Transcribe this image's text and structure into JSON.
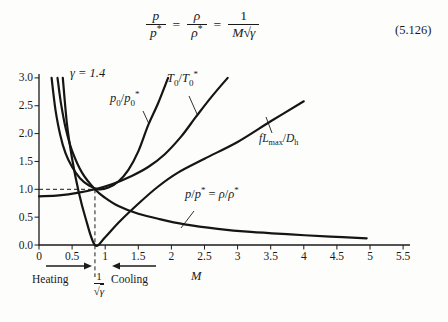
{
  "equation": {
    "f1": {
      "num": "p",
      "den": "p",
      "sup": "*"
    },
    "f2": {
      "num": "ρ",
      "den": "ρ",
      "sup": "*"
    },
    "f3": {
      "num": "1",
      "den_pre": "M",
      "radical": "√",
      "den_rad": "γ"
    },
    "eq1": "=",
    "eq2": "=",
    "number": "(5.126)"
  },
  "chart_data": {
    "type": "line",
    "title": "",
    "xlabel": "M",
    "ylabel": "",
    "gamma_label": "γ = 1.4",
    "xlim": [
      0,
      5.5
    ],
    "ylim": [
      0,
      3.0
    ],
    "grid": false,
    "x_tick_values": [
      0,
      0.5,
      1,
      1.5,
      2,
      2.5,
      3,
      3.5,
      4,
      4.5,
      5,
      5.5
    ],
    "x_tick_labels": [
      "0",
      "0.5",
      "1",
      "1.5",
      "2",
      "2.5",
      "3",
      "3.5",
      "4",
      "4.5",
      "5",
      "5.5"
    ],
    "y_tick_values": [
      0,
      0.5,
      1,
      1.5,
      2,
      2.5,
      3
    ],
    "y_tick_labels": [
      "0.0",
      "0.5",
      "1.0",
      "1.5",
      "2.0",
      "2.5",
      "3.0"
    ],
    "critical_mach": 0.845,
    "reference_value": 1.0,
    "series": [
      {
        "name": "p0/p0*",
        "points": [
          [
            0.19,
            3.0
          ],
          [
            0.25,
            2.42
          ],
          [
            0.32,
            1.98
          ],
          [
            0.4,
            1.65
          ],
          [
            0.5,
            1.4
          ],
          [
            0.62,
            1.2
          ],
          [
            0.75,
            1.07
          ],
          [
            0.9,
            1.0
          ],
          [
            1.05,
            1.03
          ],
          [
            1.2,
            1.14
          ],
          [
            1.35,
            1.35
          ],
          [
            1.5,
            1.68
          ],
          [
            1.65,
            2.15
          ],
          [
            1.8,
            2.55
          ],
          [
            1.95,
            3.0
          ]
        ]
      },
      {
        "name": "T0/T0*",
        "points": [
          [
            0.0,
            0.875
          ],
          [
            0.3,
            0.89
          ],
          [
            0.6,
            0.94
          ],
          [
            0.845,
            1.0
          ],
          [
            1.1,
            1.09
          ],
          [
            1.4,
            1.24
          ],
          [
            1.65,
            1.4
          ],
          [
            1.9,
            1.63
          ],
          [
            2.15,
            1.95
          ],
          [
            2.37,
            2.3
          ],
          [
            2.6,
            2.65
          ],
          [
            2.85,
            3.0
          ]
        ]
      },
      {
        "name": "fLmax/Dh",
        "points": [
          [
            0.36,
            3.0
          ],
          [
            0.42,
            2.2
          ],
          [
            0.5,
            1.55
          ],
          [
            0.6,
            0.95
          ],
          [
            0.7,
            0.5
          ],
          [
            0.845,
            0.0
          ],
          [
            1.0,
            0.14
          ],
          [
            1.2,
            0.4
          ],
          [
            1.5,
            0.74
          ],
          [
            1.8,
            1.05
          ],
          [
            2.1,
            1.3
          ],
          [
            2.5,
            1.55
          ],
          [
            3.0,
            1.85
          ],
          [
            3.5,
            2.22
          ],
          [
            4.0,
            2.58
          ]
        ]
      },
      {
        "name": "p/p* = ρ/ρ*",
        "points": [
          [
            0.28,
            3.0
          ],
          [
            0.33,
            2.56
          ],
          [
            0.4,
            2.11
          ],
          [
            0.5,
            1.69
          ],
          [
            0.65,
            1.3
          ],
          [
            0.845,
            1.0
          ],
          [
            1.0,
            0.845
          ],
          [
            1.2,
            0.7
          ],
          [
            1.5,
            0.56
          ],
          [
            1.8,
            0.47
          ],
          [
            2.2,
            0.37
          ],
          [
            2.7,
            0.29
          ],
          [
            3.2,
            0.235
          ],
          [
            3.8,
            0.19
          ],
          [
            4.4,
            0.15
          ],
          [
            4.95,
            0.12
          ]
        ]
      }
    ],
    "annotations": {
      "heating": "Heating",
      "cooling": "Cooling",
      "critical_frac_num": "1",
      "radical": "√",
      "gamma_symbol": "γ"
    }
  },
  "curve_labels": {
    "gamma": "γ = 1.4",
    "p0": {
      "base": "p",
      "sub": "0",
      "slash": "/",
      "base2": "p",
      "sub2": "0",
      "sup2": "*"
    },
    "t0": {
      "base": "T",
      "sub": "0",
      "slash": "/",
      "base2": "T",
      "sub2": "0",
      "sup2": "*"
    },
    "fl": {
      "f": "f",
      "L": "L",
      "sub": "max",
      "slash": "/",
      "base2": "D",
      "sub2": "h"
    },
    "pp": {
      "p": "p",
      "slash": "/",
      "p2": "p",
      "sup": "*",
      "eq": "=",
      "rho": "ρ",
      "slash2": "/",
      "rho2": "ρ",
      "sup2": "*"
    }
  }
}
